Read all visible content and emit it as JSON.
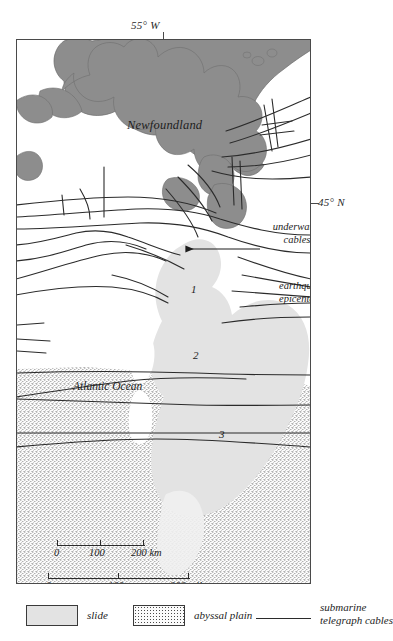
{
  "map": {
    "coordinates": {
      "top_label": "55° W",
      "right_label": "45° N"
    },
    "labels": {
      "landmass": "Newfoundland",
      "ocean": "Atlantic Ocean",
      "underwater_cables": "underwater cables",
      "epicenter": "earthquake epicenter"
    },
    "region_markers": [
      {
        "number": "1",
        "meaning": "earthquake epicenter zone"
      },
      {
        "number": "2",
        "meaning": "slide"
      },
      {
        "number": "3",
        "meaning": "abyssal plain turbidity area"
      }
    ],
    "colors": {
      "land": "#8d8d8d",
      "slide": "#e3e3e3",
      "abyssal_plain": "#fbfbfb",
      "cable_line": "#2b2b2b",
      "frame": "#4a4a4a"
    }
  },
  "scales": [
    {
      "name": "kilometers",
      "unit": "km",
      "ticks": [
        "0",
        "100",
        "200 km"
      ],
      "values": [
        0,
        100,
        200
      ],
      "bar_width_px": 88
    },
    {
      "name": "miles",
      "unit": "miles",
      "ticks": [
        "0",
        "100",
        "200 miles"
      ],
      "values": [
        0,
        100,
        200
      ],
      "bar_width_px": 142
    }
  ],
  "legend": {
    "items": [
      {
        "label": "slide",
        "swatch": "light-gray-fill"
      },
      {
        "label": "abyssal plain",
        "swatch": "stipple-fill"
      },
      {
        "label": "submarine telegraph cables",
        "label_line_1": "submarine",
        "label_line_2": "telegraph cables",
        "swatch": "line"
      }
    ]
  }
}
